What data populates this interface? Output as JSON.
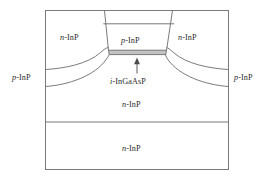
{
  "figure": {
    "type": "device-cross-section-diagram",
    "colors": {
      "outline": "#6b6b6b",
      "frame": "#7a7a7a",
      "active_layer_fill": "#c2c2c2",
      "active_layer_stroke": "#5e5e5e",
      "background": "#ffffff",
      "text": "#2b2b2b",
      "arrow": "#4a4a4a"
    },
    "labels": {
      "upper_left_region": {
        "prefix": "n",
        "suffix": "-InP",
        "full": "n-InP"
      },
      "upper_right_region": {
        "prefix": "n",
        "suffix": "-InP",
        "full": "n-InP"
      },
      "mesa_top_region": {
        "prefix": "p",
        "suffix": "-InP",
        "full": "p-InP"
      },
      "left_edge_region": {
        "prefix": "p",
        "suffix": "-InP",
        "full": "p-InP"
      },
      "right_edge_region": {
        "prefix": "p",
        "suffix": "-InP",
        "full": "p-InP"
      },
      "active_region": {
        "prefix": "i",
        "suffix": "-InGaAsP",
        "full": "i-InGaAsP"
      },
      "middle_substrate_region": {
        "prefix": "n",
        "suffix": "-InP",
        "full": "n-InP"
      },
      "bottom_substrate_region": {
        "prefix": "n",
        "suffix": "-InP",
        "full": "n-InP"
      }
    },
    "annotations": {
      "active_layer_pointer": "arrow-up"
    }
  }
}
